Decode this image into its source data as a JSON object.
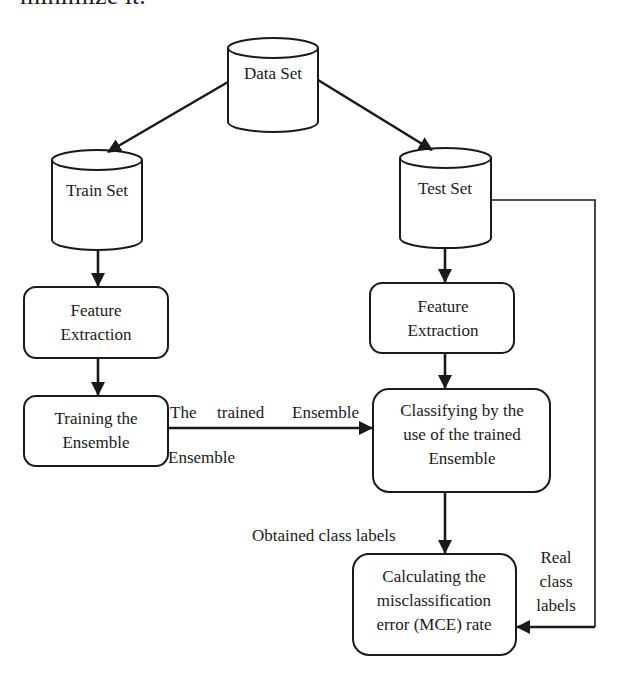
{
  "header_fragment": "minimize it.",
  "nodes": {
    "data_set": "Data Set",
    "train_set": "Train Set",
    "test_set": "Test Set",
    "feature_left": [
      "Feature",
      "Extraction"
    ],
    "feature_right": [
      "Feature",
      "Extraction"
    ],
    "training": [
      "Training the",
      "Ensemble"
    ],
    "classifying": [
      "Classifying by the",
      "use of the trained",
      "Ensemble"
    ],
    "mce": [
      "Calculating the",
      "misclassification",
      "error (MCE) rate"
    ]
  },
  "edge_labels": {
    "trained_ensemble_words": [
      "The",
      "trained",
      "Ensemble"
    ],
    "trained_ensemble_extra": "Ensemble",
    "obtained": "Obtained class labels",
    "real": [
      "Real",
      "class",
      "labels"
    ]
  },
  "colors": {
    "stroke": "#1a1a1a",
    "background": "#ffffff"
  }
}
